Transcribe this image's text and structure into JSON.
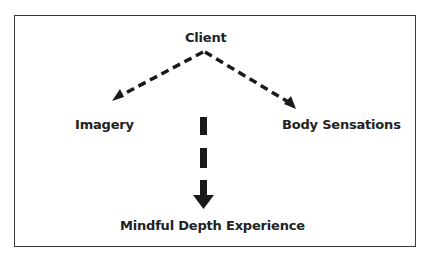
{
  "diagram": {
    "nodes": {
      "client": "Client",
      "imagery": "Imagery",
      "body_sensations": "Body Sensations",
      "mindful_depth": "Mindful Depth Experience"
    },
    "edges": [
      {
        "from": "Client",
        "to": "Imagery",
        "style": "dashed"
      },
      {
        "from": "Client",
        "to": "Body Sensations",
        "style": "dashed"
      },
      {
        "from": "Client",
        "to": "Mindful Depth Experience",
        "style": "dashed-bold"
      }
    ],
    "colors": {
      "stroke": "#1a1a1a",
      "text": "#222222",
      "border": "#3a3a3a"
    }
  }
}
